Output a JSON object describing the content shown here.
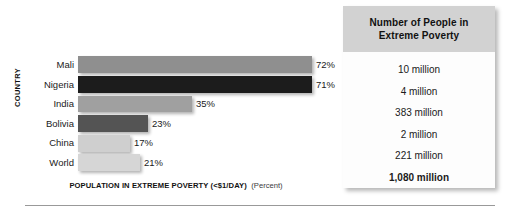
{
  "figure": {
    "y_axis_title": "COUNTRY",
    "x_axis_title_strong": "POPULATION IN EXTREME POVERTY (<$1/DAY)",
    "x_axis_title_soft": "(Percent)"
  },
  "table": {
    "header_line1": "Number of People in",
    "header_line2": "Extreme Poverty",
    "rows": [
      {
        "value": "10 million",
        "emphasis": false
      },
      {
        "value": "4 million",
        "emphasis": false
      },
      {
        "value": "383 million",
        "emphasis": false
      },
      {
        "value": "2 million",
        "emphasis": false
      },
      {
        "value": "221 million",
        "emphasis": false
      },
      {
        "value": "1,080 million",
        "emphasis": true
      }
    ]
  },
  "chart_data": {
    "type": "bar",
    "orientation": "horizontal",
    "title": "",
    "xlabel": "POPULATION IN EXTREME POVERTY (<$1/DAY) (Percent)",
    "ylabel": "COUNTRY",
    "grid": false,
    "legend": "none",
    "xlim": [
      0,
      80
    ],
    "categories": [
      "Mali",
      "Nigeria",
      "India",
      "Bolivia",
      "China",
      "World"
    ],
    "values": [
      72,
      71,
      35,
      23,
      17,
      21
    ],
    "value_labels": [
      "72%",
      "71%",
      "35%",
      "23%",
      "17%",
      "21%"
    ],
    "bar_colors": [
      "#8f8f8f",
      "#1c1c1c",
      "#a0a0a0",
      "#545454",
      "#cfcfcf",
      "#d6d6d6"
    ],
    "bar_pixel_widths": [
      234,
      234,
      114,
      70,
      52,
      62
    ],
    "secondary_series": {
      "name": "Number of People in Extreme Poverty",
      "values": [
        "10 million",
        "4 million",
        "383 million",
        "2 million",
        "221 million",
        "1,080 million"
      ]
    }
  }
}
